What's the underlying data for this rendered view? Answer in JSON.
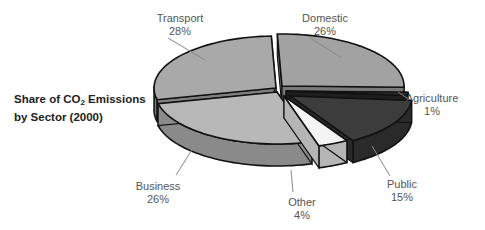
{
  "chart_data": {
    "type": "pie",
    "variant": "3d-exploded",
    "title_line1_pre": "Share of CO",
    "title_sub": "2",
    "title_line1_post": "  Emissions",
    "title_line2": "by Sector (2000)",
    "slices": [
      {
        "name": "Transport",
        "pct_label": "28%",
        "value": 28,
        "top": "#a9a9a9",
        "side": "#7f7f7f"
      },
      {
        "name": "Domestic",
        "pct_label": "26%",
        "value": 26,
        "top": "#a2a2a2",
        "side": "#7a7a7a"
      },
      {
        "name": "Agriculture",
        "pct_label": "1%",
        "value": 1,
        "top": "#2e2e2e",
        "side": "#1e1e1e"
      },
      {
        "name": "Public",
        "pct_label": "15%",
        "value": 15,
        "top": "#3c3c3c",
        "side": "#2a2a2a"
      },
      {
        "name": "Other",
        "pct_label": "4%",
        "value": 4,
        "top": "#f4f4f4",
        "side": "#b5b5b5"
      },
      {
        "name": "Business",
        "pct_label": "26%",
        "value": 26,
        "top": "#b8b8b8",
        "side": "#8a8a8a"
      }
    ]
  }
}
